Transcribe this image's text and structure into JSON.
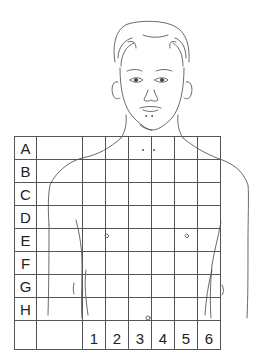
{
  "diagram": {
    "type": "body-chart-grid",
    "row_labels": [
      "A",
      "B",
      "C",
      "D",
      "E",
      "F",
      "G",
      "H"
    ],
    "column_labels": [
      "1",
      "2",
      "3",
      "4",
      "5",
      "6"
    ],
    "colors": {
      "line": "#555555",
      "text": "#222222",
      "background": "#ffffff"
    }
  }
}
